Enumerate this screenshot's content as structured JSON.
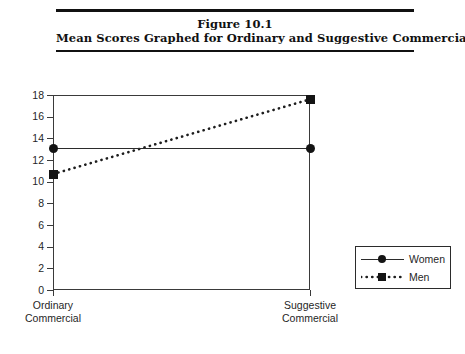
{
  "figure": {
    "number_line": "Figure 10.1",
    "caption_line": "Mean Scores Graphed for Ordinary and Suggestive Commercials"
  },
  "chart_data": {
    "type": "line",
    "title": "Mean Scores Graphed for Ordinary and Suggestive Commercials",
    "xlabel": "",
    "ylabel": "",
    "categories": [
      "Ordinary Commercial",
      "Suggestive Commercial"
    ],
    "category_lines": [
      [
        "Ordinary",
        "Commercial"
      ],
      [
        "Suggestive",
        "Commercial"
      ]
    ],
    "series": [
      {
        "name": "Women",
        "values": [
          13.1,
          13.1
        ],
        "style": "solid",
        "marker": "circle"
      },
      {
        "name": "Men",
        "values": [
          10.7,
          17.6
        ],
        "style": "dotted",
        "marker": "square"
      }
    ],
    "ylim": [
      0,
      18
    ],
    "ytick_values": [
      0,
      2,
      4,
      6,
      8,
      10,
      12,
      14,
      16,
      18
    ],
    "ytick_labels": [
      "0",
      "2",
      "4",
      "6",
      "8",
      "10",
      "12",
      "14",
      "16",
      "18"
    ],
    "grid": false,
    "legend_position": "right",
    "legend_entries": [
      "Women",
      "Men"
    ],
    "line_color": "#2b2b2b",
    "marker_color": "#141414",
    "axis_color": "#3a3a3a"
  }
}
